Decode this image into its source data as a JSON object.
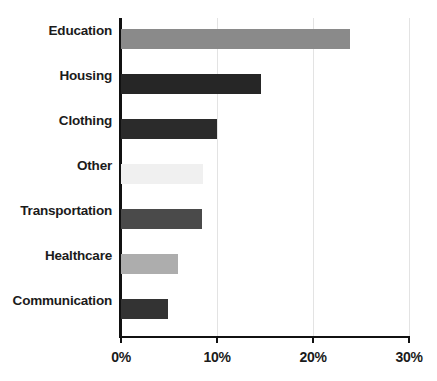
{
  "chart_data": {
    "type": "bar",
    "orientation": "horizontal",
    "title": "",
    "subtitle": "",
    "xlabel": "",
    "ylabel": "",
    "xlim": [
      0,
      30
    ],
    "xtick_labels": [
      "0%",
      "10%",
      "20%",
      "30%"
    ],
    "xtick_values": [
      0,
      10,
      20,
      30
    ],
    "grid": "vertical",
    "legend": "none",
    "value_suffix": "%",
    "categories": [
      "Education",
      "Housing",
      "Clothing",
      "Other",
      "Transportation",
      "Healthcare",
      "Communication"
    ],
    "values": [
      23.9,
      14.6,
      10.0,
      8.5,
      8.4,
      5.9,
      4.9
    ],
    "bar_colors": [
      "#8a8a8a",
      "#262626",
      "#2b2b2b",
      "#f0f0f0",
      "#4a4a4a",
      "#adadad",
      "#333333"
    ],
    "bars": [
      {
        "label": "Education",
        "value": 23.9,
        "color": "#8a8a8a"
      },
      {
        "label": "Housing",
        "value": 14.6,
        "color": "#262626"
      },
      {
        "label": "Clothing",
        "value": 10.0,
        "color": "#2b2b2b"
      },
      {
        "label": "Other",
        "value": 8.5,
        "color": "#f0f0f0"
      },
      {
        "label": "Transportation",
        "value": 8.4,
        "color": "#4a4a4a"
      },
      {
        "label": "Healthcare",
        "value": 5.9,
        "color": "#adadad"
      },
      {
        "label": "Communication",
        "value": 4.9,
        "color": "#333333"
      }
    ]
  },
  "style": {
    "background": "#ffffff",
    "axis_color": "#111111",
    "gridline_color": "#e3e3e3",
    "label_color": "#1b1b1b"
  }
}
